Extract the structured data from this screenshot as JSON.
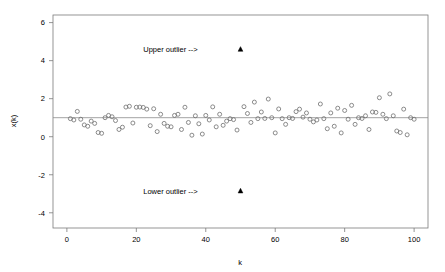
{
  "chart_data": {
    "type": "scatter",
    "title": "",
    "subtitle": "",
    "xlabel": "k",
    "ylabel": "x(k)",
    "xlim": [
      -4,
      104
    ],
    "ylim": [
      -4.8,
      6.4
    ],
    "xticks": [
      0,
      20,
      40,
      60,
      80,
      100
    ],
    "xticklabels": [
      "0",
      "20",
      "40",
      "60",
      "80",
      "100"
    ],
    "yticks": [
      6,
      4,
      2,
      0,
      -2,
      -4
    ],
    "yticklabels": [
      "6",
      "4",
      "2",
      "0",
      "-2",
      "-4"
    ],
    "grid": false,
    "legend": null,
    "reference_line": {
      "name": "mean-line",
      "orientation": "horizontal",
      "y": 1.0
    },
    "series": [
      {
        "name": "x(k)",
        "marker": "open-circle",
        "color": "#6e6e6e",
        "x": [
          1,
          2,
          3,
          4,
          5,
          6,
          7,
          8,
          9,
          10,
          11,
          12,
          13,
          14,
          15,
          16,
          17,
          18,
          19,
          20,
          21,
          22,
          23,
          24,
          25,
          26,
          27,
          28,
          29,
          30,
          31,
          32,
          33,
          34,
          35,
          36,
          37,
          38,
          39,
          40,
          41,
          42,
          43,
          44,
          45,
          46,
          47,
          48,
          49,
          51,
          52,
          53,
          54,
          55,
          56,
          57,
          58,
          59,
          60,
          61,
          62,
          63,
          64,
          65,
          66,
          67,
          68,
          69,
          70,
          71,
          72,
          73,
          74,
          75,
          76,
          77,
          78,
          79,
          80,
          81,
          82,
          83,
          84,
          85,
          86,
          87,
          88,
          89,
          90,
          91,
          92,
          93,
          94,
          95,
          96,
          97,
          98,
          99,
          100
        ],
        "y": [
          0.95,
          0.88,
          1.33,
          0.92,
          0.62,
          0.55,
          0.82,
          0.7,
          0.22,
          0.18,
          1.0,
          1.12,
          1.05,
          0.85,
          0.38,
          0.5,
          1.56,
          1.6,
          0.72,
          1.55,
          1.56,
          1.54,
          1.45,
          0.58,
          1.47,
          0.27,
          1.18,
          0.7,
          0.55,
          0.52,
          1.12,
          1.18,
          0.38,
          1.55,
          0.75,
          0.08,
          1.1,
          0.68,
          0.14,
          1.12,
          0.88,
          1.57,
          0.52,
          1.18,
          0.6,
          0.82,
          0.95,
          0.9,
          0.35,
          1.58,
          1.22,
          0.75,
          1.82,
          0.95,
          1.3,
          0.96,
          1.98,
          1.0,
          0.2,
          1.46,
          0.95,
          0.65,
          1.0,
          0.96,
          1.32,
          1.45,
          1.03,
          1.25,
          0.92,
          0.78,
          0.88,
          1.72,
          0.95,
          0.42,
          1.25,
          0.55,
          1.5,
          0.2,
          1.38,
          0.92,
          1.65,
          0.65,
          1.0,
          0.96,
          1.1,
          0.38,
          1.3,
          1.28,
          2.05,
          1.18,
          0.95,
          2.25,
          1.1,
          0.3,
          0.22,
          1.45,
          0.1,
          1.0,
          0.92
        ]
      },
      {
        "name": "outliers",
        "marker": "filled-triangle",
        "color": "#000000",
        "x": [
          50,
          50
        ],
        "y": [
          4.6,
          -2.85
        ]
      }
    ],
    "annotations": [
      {
        "name": "upper-outlier-label",
        "text": "Upper outlier -->",
        "x": 22,
        "y": 4.6,
        "anchor": "start"
      },
      {
        "name": "lower-outlier-label",
        "text": "Lower outlier -->",
        "x": 22,
        "y": -2.85,
        "anchor": "start"
      }
    ]
  }
}
